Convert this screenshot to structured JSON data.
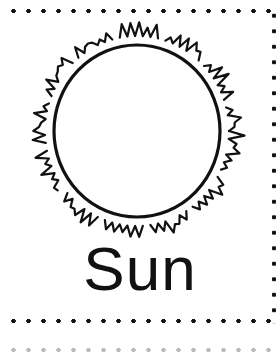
{
  "card": {
    "label": "Sun",
    "illustration": "sun-icon",
    "border_style": "dotted",
    "colors": {
      "ink": "#111111",
      "background": "#ffffff"
    }
  }
}
